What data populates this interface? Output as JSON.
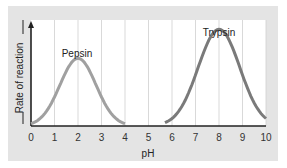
{
  "chart_data": {
    "type": "line",
    "title": "",
    "xlabel": "pH",
    "ylabel": "Rate of reaction",
    "xlim": [
      0,
      10
    ],
    "x_ticks": [
      "0",
      "1",
      "2",
      "3",
      "4",
      "5",
      "6",
      "7",
      "8",
      "9",
      "10"
    ],
    "y_ticks": [],
    "grid": {
      "vertical": true,
      "horizontal": false
    },
    "series": [
      {
        "name": "Pepsin",
        "color": "#9a9a9a",
        "peak_x": 2,
        "range": [
          0,
          4
        ],
        "peak_relative_height": 0.65,
        "x": [
          0,
          0.5,
          1,
          1.5,
          2,
          2.5,
          3,
          3.5,
          4
        ],
        "y": [
          0.02,
          0.12,
          0.35,
          0.58,
          0.65,
          0.58,
          0.35,
          0.12,
          0.02
        ]
      },
      {
        "name": "Trypsin",
        "color": "#777777",
        "peak_x": 8,
        "range": [
          5.7,
          10
        ],
        "peak_relative_height": 0.93,
        "x": [
          5.7,
          6,
          6.5,
          7,
          7.5,
          8,
          8.5,
          9,
          9.5,
          10
        ],
        "y": [
          0.01,
          0.06,
          0.22,
          0.55,
          0.85,
          0.93,
          0.85,
          0.5,
          0.15,
          0.02
        ]
      }
    ],
    "annotations": [
      "Pepsin",
      "Trypsin"
    ]
  }
}
